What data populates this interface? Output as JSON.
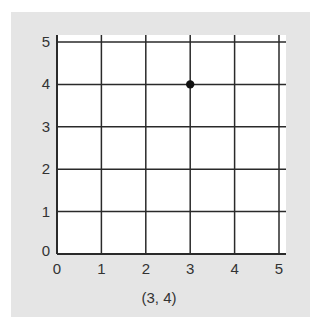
{
  "chart_data": {
    "type": "scatter",
    "title": "",
    "xlabel": "",
    "ylabel": "",
    "xlim": [
      0,
      5
    ],
    "ylim": [
      0,
      5
    ],
    "x_ticks": [
      "0",
      "1",
      "2",
      "3",
      "4",
      "5"
    ],
    "y_ticks": [
      "0",
      "1",
      "2",
      "3",
      "4",
      "5"
    ],
    "grid": true,
    "points": [
      {
        "x": 3,
        "y": 4
      }
    ],
    "caption": "(3, 4)"
  },
  "colors": {
    "panel_background": "#e5e5e5",
    "plot_background": "#ffffff",
    "grid_line": "#2a2a2a",
    "point": "#111111",
    "text": "#333333"
  }
}
